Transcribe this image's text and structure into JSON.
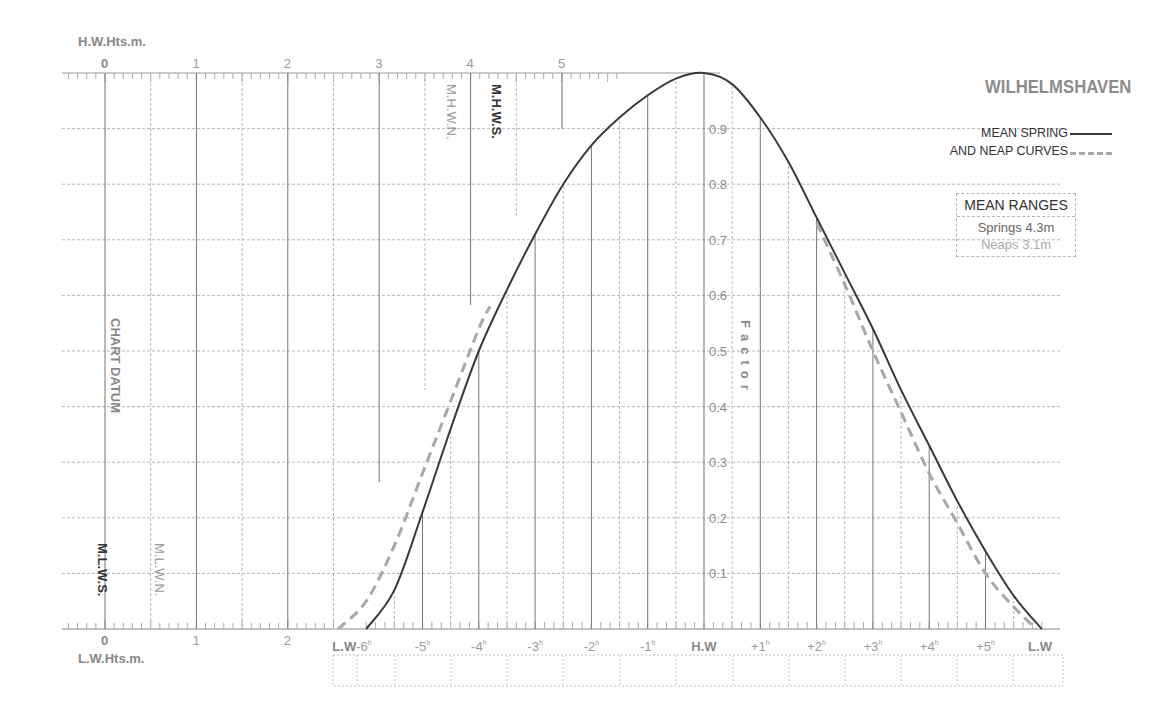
{
  "title": "WILHELMSHAVEN",
  "legend": {
    "line1": "MEAN SPRING",
    "line2": "AND NEAP CURVES",
    "spring_style": "solid",
    "neap_style": "dashed"
  },
  "mean_ranges": {
    "header": "MEAN RANGES",
    "springs": "Springs 4.3m",
    "neaps": "Neaps 3.1m"
  },
  "axes": {
    "hw_heights_label": "H.W.Hts.m.",
    "lw_heights_label": "L.W.Hts.m.",
    "height_ticks": [
      "0",
      "1",
      "2",
      "3",
      "4",
      "5"
    ],
    "lw_height_ticks": [
      "0",
      "1",
      "2"
    ],
    "factor_label": "Factor",
    "factor_ticks": [
      "0.9",
      "0.8",
      "0.7",
      "0.6",
      "0.5",
      "0.4",
      "0.3",
      "0.2",
      "0.1"
    ],
    "time_ticks": [
      "L.W-6h",
      "-5h",
      "-4h",
      "-3h",
      "-2h",
      "-1h",
      "H.W",
      "+1h",
      "+2h",
      "+3h",
      "+4h",
      "+5h",
      "L.W"
    ],
    "chart_datum_label": "CHART DATUM"
  },
  "levels": {
    "mhws": "M.H.W.S.",
    "mhwn": "M.H.W.N.",
    "mlws": "M.L.W.S.",
    "mlwn": "M.L.W.N."
  },
  "colors": {
    "spring": "#3a3a3a",
    "neap": "#a8a8a8",
    "grid": "#b8b8b8",
    "axis_text": "#8a8a8a"
  },
  "chart_data": {
    "type": "line",
    "title": "WILHELMSHAVEN",
    "xlabel": "Hours relative to High Water",
    "ylabel": "Factor",
    "ylim": [
      0,
      1
    ],
    "xlim": [
      -6.5,
      6
    ],
    "grid": true,
    "legend_position": "top-right",
    "x": [
      -6,
      -5,
      -4,
      -3,
      -2,
      -1,
      0,
      1,
      2,
      3,
      4,
      5,
      6
    ],
    "series": [
      {
        "name": "Mean Spring",
        "style": "solid",
        "x": [
          -6,
          -5.5,
          -5,
          -4.5,
          -4,
          -3.5,
          -3,
          -2.5,
          -2,
          -1.5,
          -1,
          -0.5,
          0,
          0.5,
          1,
          1.5,
          2,
          2.5,
          3,
          3.5,
          4,
          4.5,
          5,
          5.5,
          6
        ],
        "values": [
          0.0,
          0.07,
          0.21,
          0.36,
          0.5,
          0.61,
          0.71,
          0.8,
          0.87,
          0.92,
          0.96,
          0.99,
          1.0,
          0.98,
          0.92,
          0.84,
          0.74,
          0.64,
          0.54,
          0.43,
          0.33,
          0.23,
          0.14,
          0.06,
          0.0
        ]
      },
      {
        "name": "Mean Neap",
        "style": "dashed",
        "x": [
          -6.5,
          -6,
          -5.5,
          -5,
          -4.5,
          -4,
          -3.8,
          2,
          2.5,
          3,
          3.5,
          4,
          4.5,
          5,
          5.5,
          5.9
        ],
        "values": [
          0.0,
          0.05,
          0.15,
          0.28,
          0.41,
          0.54,
          0.58,
          0.73,
          0.62,
          0.5,
          0.39,
          0.28,
          0.19,
          0.1,
          0.04,
          0.0
        ]
      }
    ],
    "mean_ranges": {
      "springs_m": 4.3,
      "neaps_m": 3.1
    },
    "hw_height_axis_m": [
      0,
      5
    ],
    "levels_m": {
      "MHWS": 4.2,
      "MHWN": 3.8,
      "MLWS": 0.0,
      "MLWN": 0.55
    }
  }
}
